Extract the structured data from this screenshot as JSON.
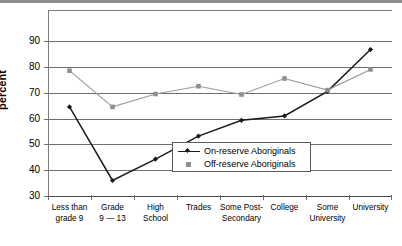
{
  "chart_data": {
    "type": "line",
    "title": "",
    "xlabel": "",
    "ylabel": "percent",
    "ylim": [
      30,
      102
    ],
    "yticks": [
      30,
      40,
      50,
      60,
      70,
      80,
      90
    ],
    "grid": true,
    "legend_position": "inside-lower-right",
    "categories": [
      "Less than grade 9",
      "Grade 9 — 13",
      "High School",
      "Trades",
      "Some Post-Secondary",
      "College",
      "Some University",
      "University"
    ],
    "category_lines": [
      [
        "Less than",
        "grade 9"
      ],
      [
        "Grade",
        "9 — 13"
      ],
      [
        "High",
        "School"
      ],
      [
        "Trades",
        ""
      ],
      [
        "Some Post-",
        "Secondary"
      ],
      [
        "College",
        ""
      ],
      [
        "Some",
        "University"
      ],
      [
        "University",
        ""
      ]
    ],
    "series": [
      {
        "name": "On-reserve Aboriginals",
        "color": "#1a1a1a",
        "marker": "diamond",
        "values": [
          64.5,
          36.0,
          44.3,
          53.2,
          59.3,
          61.0,
          70.5,
          86.7
        ]
      },
      {
        "name": "Off-reserve Aboriginals",
        "color": "#9a9a9a",
        "marker": "square",
        "values": [
          78.5,
          64.5,
          69.5,
          72.5,
          69.3,
          75.5,
          71.0,
          79.0
        ]
      }
    ]
  },
  "axis": {
    "y_title": "percent",
    "tick_labels": [
      "90",
      "80",
      "70",
      "60",
      "50",
      "40",
      "30"
    ]
  },
  "legend": {
    "items": [
      {
        "label": "On-reserve Aboriginals"
      },
      {
        "label": "Off-reserve Aboriginals"
      }
    ]
  },
  "colors": {
    "on_reserve": "#1a1a1a",
    "off_reserve": "#9a9a9a",
    "gridline": "#6f6f6f",
    "top_rule": "#8c8c8c"
  }
}
